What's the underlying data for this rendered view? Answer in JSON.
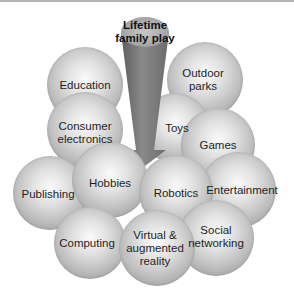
{
  "diagram": {
    "title": "Lifetime family play",
    "title_line1": "Lifetime",
    "title_line2": "family play",
    "nodes": [
      {
        "id": "education",
        "label": "Education"
      },
      {
        "id": "outdoor-parks",
        "line1": "Outdoor",
        "line2": "parks"
      },
      {
        "id": "consumer-electronics",
        "line1": "Consumer",
        "line2": "electronics"
      },
      {
        "id": "toys",
        "label": "Toys"
      },
      {
        "id": "games",
        "label": "Games"
      },
      {
        "id": "publishing",
        "label": "Publishing"
      },
      {
        "id": "hobbies",
        "label": "Hobbies"
      },
      {
        "id": "robotics",
        "label": "Robotics"
      },
      {
        "id": "entertainment",
        "label": "Entertainment"
      },
      {
        "id": "computing",
        "label": "Computing"
      },
      {
        "id": "virtual-augmented-reality",
        "line1": "Virtual &",
        "line2": "augmented",
        "line3": "reality"
      },
      {
        "id": "social-networking",
        "line1": "Social",
        "line2": "networking"
      }
    ],
    "colors": {
      "cone_dark": "#6e6e6e",
      "cone_light": "#9a9a9a",
      "sphere": "#c4c4c4"
    }
  }
}
